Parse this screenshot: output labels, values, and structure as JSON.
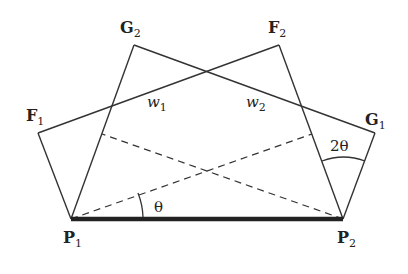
{
  "diagram": {
    "type": "geometric-construction",
    "colors": {
      "line": "#333333",
      "base": "#222222",
      "background": "#ffffff"
    },
    "points": {
      "P1": {
        "label": "P",
        "sub": "1",
        "x": 71,
        "y": 219
      },
      "P2": {
        "label": "P",
        "sub": "2",
        "x": 343,
        "y": 219
      },
      "F1": {
        "label": "F",
        "sub": "1",
        "x": 38,
        "y": 133
      },
      "F2": {
        "label": "F",
        "sub": "2",
        "x": 279,
        "y": 45
      },
      "G1": {
        "label": "G",
        "sub": "1",
        "x": 375,
        "y": 133
      },
      "G2": {
        "label": "G",
        "sub": "2",
        "x": 134,
        "y": 45
      }
    },
    "labels": {
      "w1": {
        "text": "w",
        "sub": "1"
      },
      "w2": {
        "text": "w",
        "sub": "2"
      },
      "theta": "θ",
      "two_theta": "2θ"
    },
    "edges": [
      [
        "P1",
        "F1"
      ],
      [
        "F1",
        "F2"
      ],
      [
        "F2",
        "P2"
      ],
      [
        "P1",
        "G2"
      ],
      [
        "G2",
        "G1"
      ],
      [
        "G1",
        "P2"
      ]
    ],
    "base_edge": [
      "P1",
      "P2"
    ],
    "dashed_edges": [
      "P1 to point on P2–F2",
      "P2 to point on P1–G2"
    ]
  }
}
